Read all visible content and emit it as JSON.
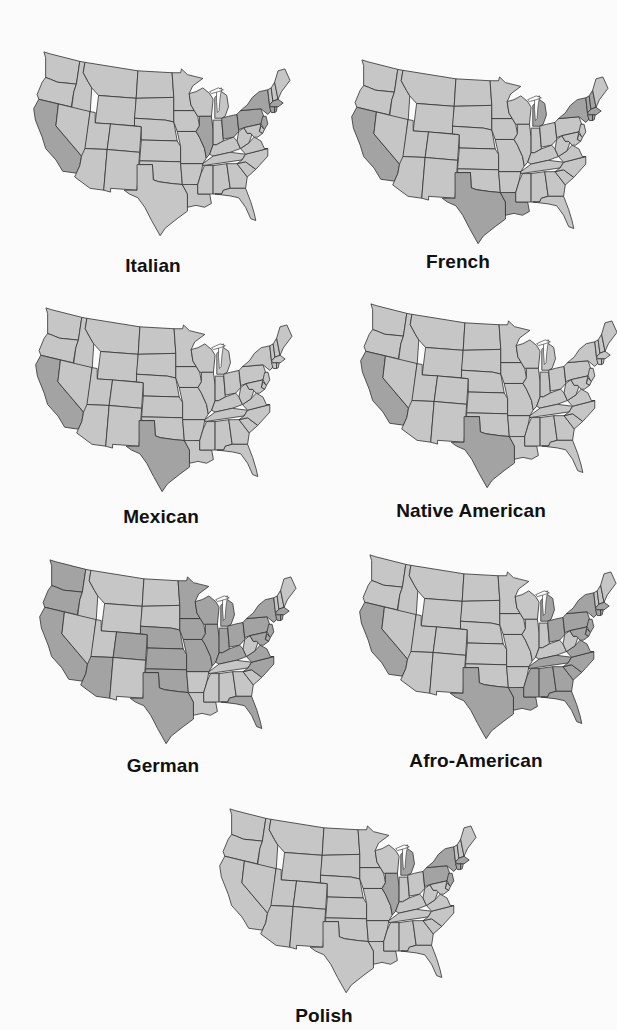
{
  "figure": {
    "colors": {
      "background": "#fbfbfb",
      "base": "#c6c6c6",
      "highlight": "#a3a3a3",
      "border": "#333333",
      "label": "#111111"
    },
    "maps": [
      {
        "id": "italian",
        "label": "Italian",
        "highlighted_states": [
          "CA",
          "IL",
          "OH",
          "PA",
          "NY",
          "NJ",
          "CT",
          "RI",
          "MA"
        ]
      },
      {
        "id": "french",
        "label": "French",
        "highlighted_states": [
          "CA",
          "TX",
          "LA",
          "MI",
          "NY",
          "MA",
          "RI",
          "CT",
          "NH",
          "VT"
        ]
      },
      {
        "id": "mexican",
        "label": "Mexican",
        "highlighted_states": [
          "CA",
          "TX"
        ]
      },
      {
        "id": "native-american",
        "label": "Native American",
        "highlighted_states": [
          "CA",
          "TX"
        ]
      },
      {
        "id": "german",
        "label": "German",
        "highlighted_states": [
          "WA",
          "OR",
          "CA",
          "AZ",
          "CO",
          "NE",
          "KS",
          "OK",
          "TX",
          "MN",
          "IA",
          "MO",
          "WI",
          "MI",
          "IL",
          "IN",
          "OH",
          "KY",
          "PA",
          "NY",
          "NJ",
          "VA",
          "NC",
          "FL",
          "MD",
          "DE",
          "CT",
          "MA",
          "RI"
        ]
      },
      {
        "id": "afro-american",
        "label": "Afro-American",
        "highlighted_states": [
          "CA",
          "TX",
          "LA",
          "MS",
          "AL",
          "GA",
          "SC",
          "NC",
          "VA",
          "TN",
          "FL",
          "MI",
          "OH",
          "PA",
          "NY",
          "NJ",
          "MD",
          "DE",
          "CT",
          "MA",
          "RI"
        ]
      },
      {
        "id": "polish",
        "label": "Polish",
        "highlighted_states": [
          "IL",
          "MI",
          "PA",
          "NY",
          "NJ",
          "CT",
          "MA",
          "RI"
        ]
      }
    ]
  }
}
